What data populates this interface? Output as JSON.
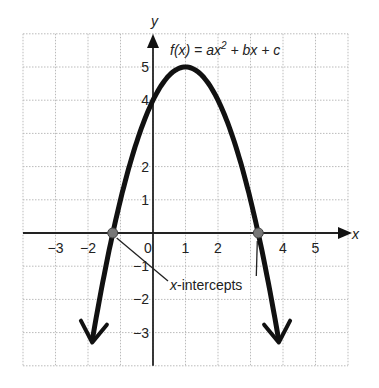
{
  "chart_data": {
    "type": "line",
    "function": "f(x) = -(x-1)^2 + 5",
    "xlabel": "x",
    "ylabel": "y",
    "xlim": [
      -4,
      6
    ],
    "ylim": [
      -4,
      6
    ],
    "grid": true,
    "x_tick_labels": [
      "−3",
      "−2",
      "0",
      "1",
      "2",
      "4",
      "5"
    ],
    "x_tick_values": [
      -3,
      -2,
      0,
      1,
      2,
      4,
      5
    ],
    "y_tick_labels": [
      "5",
      "4",
      "2",
      "1",
      "−1",
      "−2",
      "−3"
    ],
    "y_tick_values": [
      5,
      4,
      2,
      1,
      -1,
      -2,
      -3
    ],
    "vertex": [
      1,
      5
    ],
    "y_intercept": 4,
    "x_intercepts": [
      -1.24,
      3.24
    ],
    "annotation": "x-intercepts",
    "x": [
      -1.9,
      -1.5,
      -1,
      -0.5,
      0,
      0.5,
      1,
      1.5,
      2,
      2.5,
      3,
      3.5,
      3.9
    ],
    "values": [
      -3.41,
      -1.25,
      1,
      2.75,
      4,
      4.75,
      5,
      4.75,
      4,
      2.75,
      1,
      -1.25,
      -3.41
    ]
  },
  "labels": {
    "title_fx": "f(x) = ax",
    "title_sup": "2",
    "title_rest": " + bx + c",
    "x_axis": "x",
    "y_axis": "y",
    "annotation_x": "x",
    "annotation_rest": "-intercepts"
  }
}
